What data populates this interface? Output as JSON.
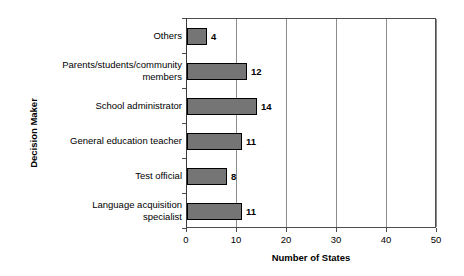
{
  "chart_data": {
    "type": "bar",
    "orientation": "horizontal",
    "title": "",
    "xlabel": "Number of States",
    "ylabel": "Decision Maker",
    "categories": [
      "Others",
      "Parents/students/community members",
      "School administrator",
      "General education teacher",
      "Test official",
      "Language acquisition specialist"
    ],
    "values": [
      4,
      12,
      14,
      11,
      8,
      11
    ],
    "value_labels": [
      "4",
      "12",
      "14",
      "11",
      "8",
      "11"
    ],
    "xlim": [
      0,
      50
    ],
    "xticks": [
      0,
      10,
      20,
      30,
      40,
      50
    ],
    "xtick_labels": [
      "0",
      "10",
      "20",
      "30",
      "40",
      "50"
    ],
    "grid": "vertical",
    "legend": "none",
    "bar_fill_color": "#757575",
    "bar_border_color": "#000000",
    "gridline_color": "#8c8c8c",
    "axis_color": "#4d4d4d",
    "background_color": "#ffffff"
  },
  "axis": {
    "x_title": "Number of States",
    "y_title": "Decision Maker"
  },
  "categories_display": [
    {
      "line1": "Others",
      "line2": ""
    },
    {
      "line1": "Parents/students/community",
      "line2": "members"
    },
    {
      "line1": "School administrator",
      "line2": ""
    },
    {
      "line1": "General education teacher",
      "line2": ""
    },
    {
      "line1": "Test official",
      "line2": ""
    },
    {
      "line1": "Language acquisition",
      "line2": "specialist"
    }
  ]
}
